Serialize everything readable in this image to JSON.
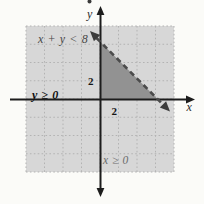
{
  "figure": {
    "labels": {
      "boundary_inequality": "x + y < 8",
      "y_inequality": "y ≥ 0",
      "x_inequality": "x ≥ 0",
      "x_axis": "x",
      "y_axis": "y",
      "x_tick": "2",
      "y_tick": "2"
    },
    "colors": {
      "page_bg": "#fbfbf8",
      "grid_bg": "#d7d7d7",
      "grid_line": "#b3b3b3",
      "region_fill": "#929292",
      "boundary_line": "#4b4b4b",
      "axis": "#1c1c1c",
      "gray_label": "#6b6b6b",
      "black_label": "#101010"
    }
  },
  "chart_data": {
    "type": "area",
    "inequalities": [
      "x + y < 8",
      "y ≥ 0",
      "x ≥ 0"
    ],
    "boundary_line": {
      "equation": "x + y = 8",
      "style": "dashed",
      "points": [
        {
          "x": 0,
          "y": 8
        },
        {
          "x": 8,
          "y": 0
        }
      ]
    },
    "solution_region_vertices": [
      {
        "x": 0,
        "y": 0
      },
      {
        "x": 0,
        "y": 8
      },
      {
        "x": 8,
        "y": 0
      }
    ],
    "axes": {
      "x_label": "x",
      "y_label": "y",
      "shown_tick_value": 2,
      "grid_step": 2,
      "xlim": [
        -8,
        8
      ],
      "ylim": [
        -8,
        8
      ]
    },
    "grid": true,
    "legend": false
  }
}
